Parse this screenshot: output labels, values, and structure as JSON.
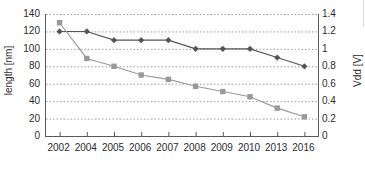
{
  "chart_data": {
    "type": "line",
    "title": "",
    "xlabel": "",
    "categories": [
      "2002",
      "2004",
      "2005",
      "2006",
      "2007",
      "2008",
      "2009",
      "2010",
      "2013",
      "2016"
    ],
    "grid": true,
    "legend": "none",
    "axes": {
      "left": {
        "label": "length [nm]",
        "min": 0,
        "max": 140,
        "step": 20,
        "ticks": [
          "0",
          "20",
          "40",
          "60",
          "80",
          "100",
          "120",
          "140"
        ]
      },
      "right": {
        "label": "Vdd [V]",
        "min": 0,
        "max": 1.4,
        "step": 0.2,
        "ticks": [
          "0",
          "0.2",
          "0.4",
          "0.6",
          "0.8",
          "1",
          "1.2",
          "1.4"
        ]
      }
    },
    "series": [
      {
        "name": "length [nm]",
        "axis": "left",
        "marker": "diamond",
        "color": "#555555",
        "values": [
          120,
          120,
          110,
          110,
          110,
          100,
          100,
          100,
          90,
          80
        ]
      },
      {
        "name": "Vdd [V]",
        "axis": "right",
        "marker": "square",
        "color": "#999999",
        "values": [
          1.3,
          0.89,
          0.8,
          0.7,
          0.65,
          0.57,
          0.51,
          0.45,
          0.32,
          0.22
        ]
      }
    ]
  },
  "colors": {
    "series_length": "#555555",
    "series_vdd": "#999999",
    "axis": "#5a5a5a",
    "grid": "#9a9a9a",
    "text": "#2b2b2b",
    "background": "#ffffff"
  }
}
